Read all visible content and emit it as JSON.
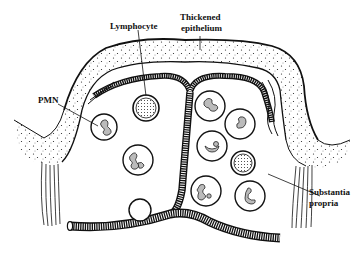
{
  "figure": {
    "style": "black line art on white, stippled epithelium",
    "colors": {
      "ink": "#111111",
      "background": "#ffffff"
    }
  },
  "labels": {
    "lymphocyte": "Lymphocyte",
    "thickened_epithelium_line1": "Thickened",
    "thickened_epithelium_line2": "epithelium",
    "pmn": "PMN",
    "substantia_propria_line1": "Substantia",
    "substantia_propria_line2": "propria"
  },
  "structures": {
    "pmn_cells": 8,
    "lymphocytes": 2,
    "vessel": "branching capillary (vertical trunk with horizontal branches)"
  }
}
